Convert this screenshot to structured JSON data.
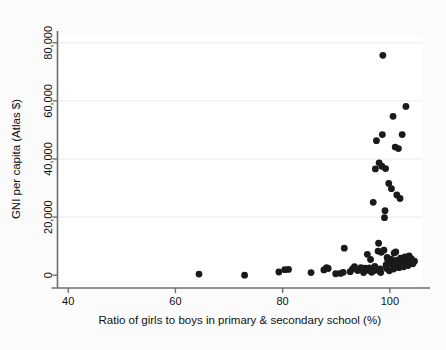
{
  "figure": {
    "background_color": "#fbfbfb",
    "plot_background_color": "#ffffff",
    "marker_color": "#1a1a1a",
    "axis_color": "#6f6f6f",
    "grid_color": "#ececec"
  },
  "chart_data": {
    "type": "scatter",
    "title": "",
    "xlabel": "Ratio of girls to boys in primary & secondary school (%)",
    "ylabel": "GNI per capita (Atlas $)",
    "xlim": [
      38,
      106
    ],
    "ylim": [
      -2000,
      82000
    ],
    "xticks": [
      40,
      60,
      80,
      100
    ],
    "xtick_labels": [
      "40",
      "60",
      "80",
      "100"
    ],
    "yticks": [
      0,
      20000,
      40000,
      60000,
      80000
    ],
    "ytick_labels": [
      "0",
      "20,000",
      "40,000",
      "60,000",
      "80,000"
    ],
    "grid": "horizontal-faint",
    "legend": null,
    "marker_size": 3.4,
    "points": [
      [
        64.4,
        400
      ],
      [
        72.9,
        0
      ],
      [
        79.3,
        1100
      ],
      [
        80.4,
        1900
      ],
      [
        81.1,
        2000
      ],
      [
        85.3,
        900
      ],
      [
        87.7,
        1800
      ],
      [
        88.2,
        2600
      ],
      [
        88.5,
        2300
      ],
      [
        89.9,
        500
      ],
      [
        90.8,
        600
      ],
      [
        91.3,
        1000
      ],
      [
        91.5,
        9300
      ],
      [
        92.6,
        1200
      ],
      [
        93.0,
        2100
      ],
      [
        93.4,
        2900
      ],
      [
        94.0,
        1600
      ],
      [
        94.6,
        2600
      ],
      [
        95.1,
        900
      ],
      [
        95.4,
        2400
      ],
      [
        95.8,
        7200
      ],
      [
        96.0,
        1700
      ],
      [
        96.2,
        2500
      ],
      [
        96.4,
        5400
      ],
      [
        96.6,
        1000
      ],
      [
        96.9,
        25100
      ],
      [
        97.0,
        1500
      ],
      [
        97.2,
        3000
      ],
      [
        97.3,
        36600
      ],
      [
        97.5,
        46300
      ],
      [
        97.6,
        2000
      ],
      [
        97.8,
        8300
      ],
      [
        97.9,
        11000
      ],
      [
        98.0,
        38700
      ],
      [
        98.1,
        1300
      ],
      [
        98.2,
        2200
      ],
      [
        98.3,
        900
      ],
      [
        98.4,
        7900
      ],
      [
        98.5,
        37500
      ],
      [
        98.6,
        48400
      ],
      [
        98.7,
        75700
      ],
      [
        98.9,
        8600
      ],
      [
        99.0,
        19800
      ],
      [
        99.1,
        22200
      ],
      [
        99.2,
        36700
      ],
      [
        99.3,
        3500
      ],
      [
        99.4,
        2300
      ],
      [
        99.5,
        6100
      ],
      [
        99.6,
        5300
      ],
      [
        99.8,
        31600
      ],
      [
        99.9,
        1500
      ],
      [
        100.0,
        3800
      ],
      [
        100.2,
        5500
      ],
      [
        100.3,
        29800
      ],
      [
        100.4,
        4400
      ],
      [
        100.6,
        54700
      ],
      [
        100.7,
        2100
      ],
      [
        100.8,
        7600
      ],
      [
        100.9,
        3100
      ],
      [
        101.0,
        44100
      ],
      [
        101.1,
        8000
      ],
      [
        101.2,
        5100
      ],
      [
        101.3,
        27600
      ],
      [
        101.5,
        4000
      ],
      [
        101.6,
        43600
      ],
      [
        101.7,
        2600
      ],
      [
        101.9,
        26400
      ],
      [
        102.0,
        5900
      ],
      [
        102.2,
        3600
      ],
      [
        102.3,
        48400
      ],
      [
        102.4,
        4700
      ],
      [
        102.6,
        2900
      ],
      [
        102.8,
        6300
      ],
      [
        102.9,
        4200
      ],
      [
        103.0,
        58100
      ],
      [
        103.2,
        5000
      ],
      [
        103.4,
        3300
      ],
      [
        103.6,
        6600
      ],
      [
        103.8,
        4500
      ],
      [
        104.0,
        5700
      ],
      [
        104.3,
        3900
      ],
      [
        104.6,
        4800
      ]
    ]
  }
}
